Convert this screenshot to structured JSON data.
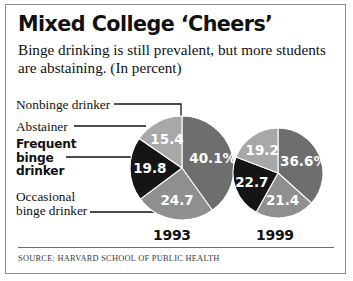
{
  "frame": {
    "title": "Mixed College ‘Cheers’",
    "subtitle": "Binge drinking  is still prevalent, but more students are abstaining. (In percent)",
    "source": "SOURCE: HARVARD SCHOOL OF PUBLIC HEALTH"
  },
  "labels": {
    "nonbinge": "Nonbinge drinker",
    "abstainer": "Abstainer",
    "frequent_line1": "Frequent",
    "frequent_line2": "binge",
    "frequent_line3": "drinker",
    "occasional_line1": "Occasional",
    "occasional_line2": "binge drinker"
  },
  "years": {
    "left": "1993",
    "right": "1999"
  },
  "colors": {
    "nonbinge": "#6e6e6e",
    "occasional": "#8f8f8f",
    "frequent": "#151515",
    "abstainer": "#a8a8a8",
    "text": "#111111",
    "value_text": "#ffffff",
    "border": "#8c8c8c",
    "rule": "#6e6e6e"
  },
  "chart_data": {
    "type": "pie",
    "title": "Mixed College ‘Cheers’",
    "subtitle": "Binge drinking  is still prevalent, but more students are abstaining. (In percent)",
    "unit": "percent",
    "source": "SOURCE: HARVARD SCHOOL OF PUBLIC HEALTH",
    "categories": [
      "Nonbinge drinker",
      "Occasional binge drinker",
      "Frequent binge drinker",
      "Abstainer"
    ],
    "series": [
      {
        "name": "1993",
        "values": [
          40.1,
          24.7,
          19.8,
          15.4
        ],
        "display_labels": [
          "40.1%",
          "24.7",
          "19.8",
          "15.4"
        ]
      },
      {
        "name": "1999",
        "values": [
          36.6,
          21.4,
          22.7,
          19.2
        ],
        "display_labels": [
          "36.6%",
          "21.4",
          "22.7",
          "19.2"
        ]
      }
    ],
    "legend": "leader-lines-left",
    "grid": false
  }
}
